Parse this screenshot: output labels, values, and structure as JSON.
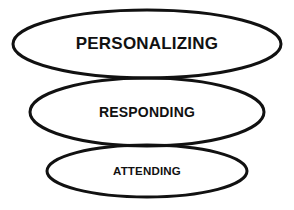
{
  "diagram": {
    "background_color": "#ffffff",
    "stroke_color": "#111111",
    "text_color": "#111111",
    "stroke_width": 3,
    "levels": [
      {
        "label": "PERSONALIZING",
        "order": 1,
        "cx": 147,
        "cy": 44,
        "rx": 134,
        "ry": 34,
        "font_size": 17
      },
      {
        "label": "RESPONDING",
        "order": 2,
        "cx": 147,
        "cy": 112,
        "rx": 117,
        "ry": 34,
        "font_size": 14
      },
      {
        "label": "ATTENDING",
        "order": 3,
        "cx": 147,
        "cy": 171,
        "rx": 100,
        "ry": 26,
        "font_size": 11.5
      }
    ]
  }
}
